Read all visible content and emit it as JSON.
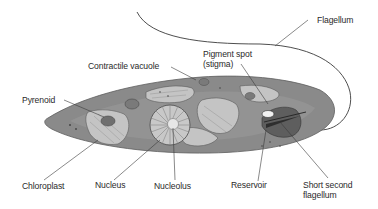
{
  "diagram": {
    "labels": {
      "flagellum": "Flagellum",
      "pigment_spot": "Pigment spot\n(stigma)",
      "contractile_vacuole": "Contractile vacuole",
      "pyrenoid": "Pyrenoid",
      "chloroplast": "Chloroplast",
      "nucleus": "Nucleus",
      "nucleolus": "Nucleolus",
      "reservoir": "Reservoir",
      "short_second_flagellum": "Short second\nflagellum"
    },
    "colors": {
      "cell_body": "#8a8a8a",
      "cell_edge": "#5e5e5e",
      "organelle_light": "#c9c9c9",
      "organelle_dark": "#6f6f6f",
      "leader_line": "#3a3a3a",
      "text": "#2a2a2a"
    }
  }
}
